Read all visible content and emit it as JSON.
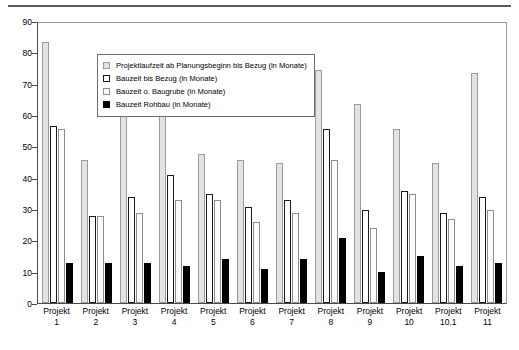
{
  "chart_data": {
    "type": "bar",
    "title": "",
    "subtitle": "",
    "xlabel": "",
    "ylabel": "",
    "ylim": [
      0,
      90
    ],
    "ytick_step": 10,
    "yticks": [
      0,
      10,
      20,
      30,
      40,
      50,
      60,
      70,
      80,
      90
    ],
    "grid": false,
    "legend_position": "top-left inside plot",
    "categories": [
      "Projekt 1",
      "Projekt 2",
      "Projekt 3",
      "Projekt 4",
      "Projekt 5",
      "Projekt 6",
      "Projekt 7",
      "Projekt 8",
      "Projekt 9",
      "Projekt 10",
      "Projekt 10.1",
      "Projekt 11"
    ],
    "category_lines": [
      [
        "Projekt",
        "1"
      ],
      [
        "Projekt",
        "2"
      ],
      [
        "Projekt",
        "3"
      ],
      [
        "Projekt",
        "4"
      ],
      [
        "Projekt",
        "5"
      ],
      [
        "Projekt",
        "6"
      ],
      [
        "Projekt",
        "7"
      ],
      [
        "Projekt",
        "8"
      ],
      [
        "Projekt",
        "9"
      ],
      [
        "Projekt",
        "10"
      ],
      [
        "Projekt",
        "10.1"
      ],
      [
        "Projekt",
        "11"
      ]
    ],
    "series": [
      {
        "name": "Projektlaufzeit ab Planungsbeginn bis Bezug (in Monate)",
        "color": "#e3e3e3",
        "edge": "#9b9b9b",
        "values": [
          84,
          46,
          61,
          62,
          48,
          46,
          45,
          75,
          64,
          56,
          45,
          74
        ]
      },
      {
        "name": "Bauzeit bis Bezug (in Monate)",
        "color": "#fdfdfd",
        "edge": "#1a1a1a",
        "values": [
          57,
          28,
          34,
          41,
          35,
          31,
          33,
          56,
          30,
          36,
          29,
          34
        ]
      },
      {
        "name": "Bauzeit o. Baugrube (in Monate)",
        "color": "#fbfbfb",
        "edge": "#8d8d8d",
        "values": [
          56,
          28,
          29,
          33,
          33,
          26,
          29,
          46,
          24,
          35,
          27,
          30
        ]
      },
      {
        "name": "Bauzeit Rohbau (in Monate)",
        "color": "#000000",
        "edge": "#000000",
        "values": [
          13,
          13,
          13,
          12,
          14,
          11,
          14,
          21,
          10,
          15,
          12,
          13
        ]
      }
    ]
  }
}
